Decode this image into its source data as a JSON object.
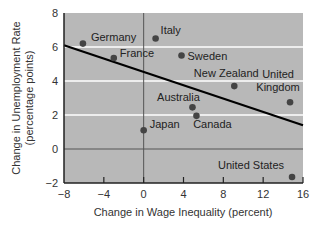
{
  "chart_data": {
    "type": "scatter",
    "title": "",
    "xlabel": "Change in Wage Inequality (percent)",
    "ylabel": "Change in Unemployment Rate (percentage points)",
    "ylabel_lines": [
      "Change in Unemployment Rate",
      "(percentage points)"
    ],
    "xlim": [
      -8,
      16
    ],
    "ylim": [
      -2,
      8
    ],
    "xticks": [
      -8,
      -4,
      0,
      4,
      8,
      12,
      16
    ],
    "yticks": [
      -2,
      0,
      2,
      4,
      6,
      8
    ],
    "xtick_labels": [
      "−8",
      "−4",
      "0",
      "4",
      "8",
      "12",
      "16"
    ],
    "ytick_labels": [
      "−2",
      "0",
      "2",
      "4",
      "6",
      "8"
    ],
    "grid": {
      "horizontal_at": [
        2,
        4,
        6
      ],
      "color": "#ffffff"
    },
    "reference_lines": {
      "x0": true,
      "y0": true
    },
    "points": [
      {
        "label": "Germany",
        "label_lines": [
          "Germany"
        ],
        "x": -6.1,
        "y": 6.2,
        "label_dx": 8,
        "label_dy": -3,
        "anchor": "start"
      },
      {
        "label": "France",
        "label_lines": [
          "France"
        ],
        "x": -3.0,
        "y": 5.35,
        "label_dx": 6,
        "label_dy": -1,
        "anchor": "start"
      },
      {
        "label": "Italy",
        "label_lines": [
          "Italy"
        ],
        "x": 1.2,
        "y": 6.5,
        "label_dx": 5,
        "label_dy": -5,
        "anchor": "start"
      },
      {
        "label": "Sweden",
        "label_lines": [
          "Sweden"
        ],
        "x": 3.8,
        "y": 5.5,
        "label_dx": 6,
        "label_dy": 4,
        "anchor": "start"
      },
      {
        "label": "New Zealand",
        "label_lines": [
          "New Zealand"
        ],
        "x": 9.1,
        "y": 3.7,
        "label_dx": -8,
        "label_dy": -9,
        "anchor": "middle"
      },
      {
        "label": "United Kingdom",
        "label_lines": [
          "United",
          "Kingdom"
        ],
        "x": 14.7,
        "y": 2.75,
        "label_dx": -12,
        "label_dy": -24,
        "anchor": "middle"
      },
      {
        "label": "Australia",
        "label_lines": [
          "Australia"
        ],
        "x": 4.9,
        "y": 2.45,
        "label_dx": -14,
        "label_dy": -6,
        "anchor": "middle"
      },
      {
        "label": "Canada",
        "label_lines": [
          "Canada"
        ],
        "x": 5.3,
        "y": 1.95,
        "label_dx": 16,
        "label_dy": 12,
        "anchor": "middle"
      },
      {
        "label": "Japan",
        "label_lines": [
          "Japan"
        ],
        "x": 0.0,
        "y": 1.1,
        "label_dx": 6,
        "label_dy": -2,
        "anchor": "start"
      },
      {
        "label": "United States",
        "label_lines": [
          "United States"
        ],
        "x": 14.9,
        "y": -1.65,
        "label_dx": -8,
        "label_dy": -8,
        "anchor": "end"
      }
    ],
    "trendline": {
      "x": [
        -8,
        16
      ],
      "y": [
        6.1,
        1.4
      ]
    },
    "colors": {
      "plot_background": "#b8b8b8",
      "points": "#444444",
      "trendline": "#000000",
      "axes": "#222222",
      "gridlines": "#ffffff"
    }
  }
}
